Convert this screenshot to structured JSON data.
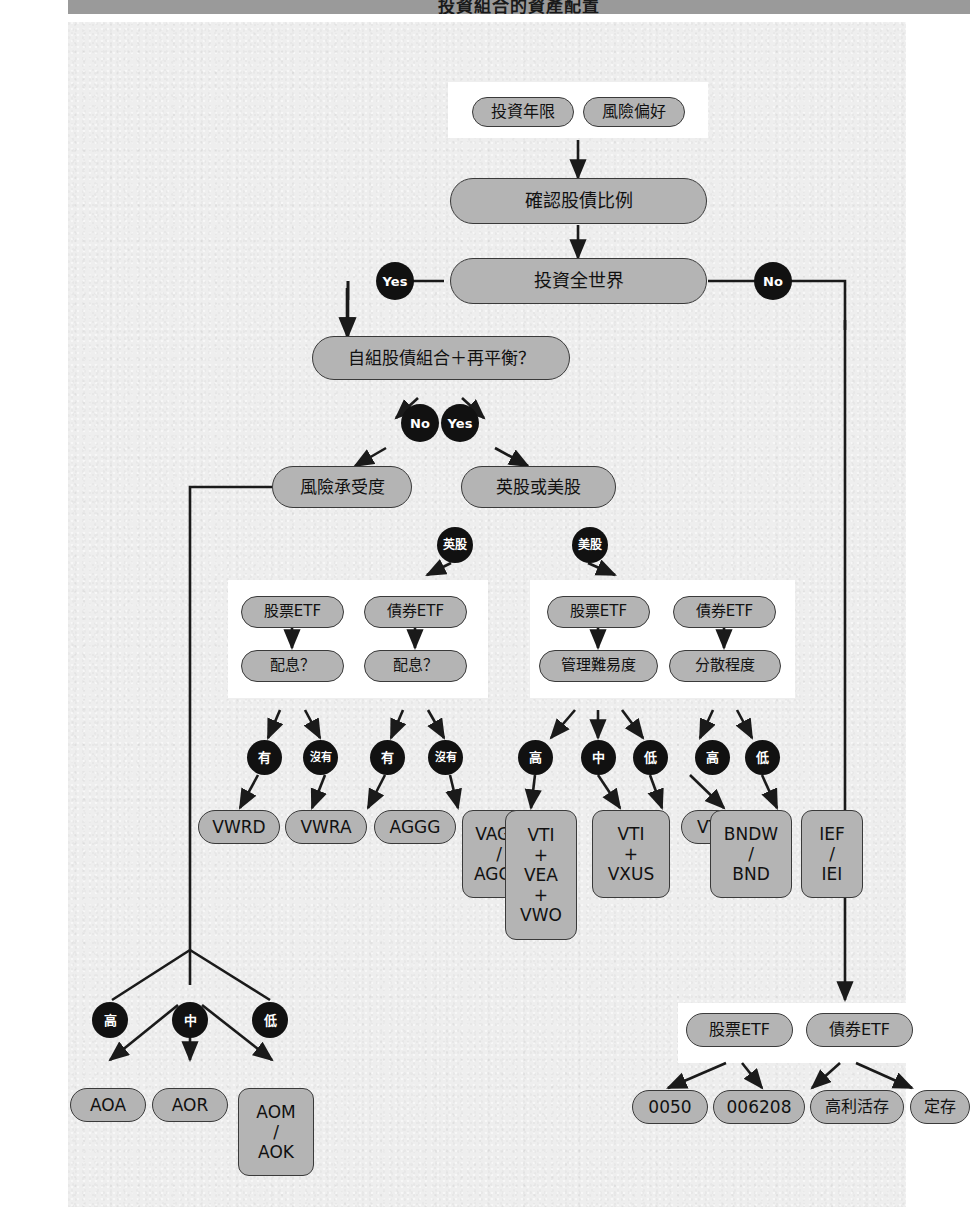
{
  "title": "投資組合的資產配置",
  "colors": {
    "node_fill": "#b4b4b4",
    "node_stroke": "#3a3a3a",
    "dot_fill": "#111111",
    "panel_fill": "#ffffff",
    "paper": "#eeeeee",
    "title_band": "#9a9a9a"
  },
  "nodes": {
    "invest_years": "投資年限",
    "risk_preference": "風險偏好",
    "confirm_ratio": "確認股債比例",
    "invest_world": "投資全世界",
    "self_build": "自組股債組合＋再平衡？",
    "risk_tolerance": "風險承受度",
    "uk_or_us": "英股或美股",
    "uk_stock_etf": "股票ETF",
    "uk_bond_etf": "債券ETF",
    "uk_dividend_stock": "配息？",
    "uk_dividend_bond": "配息？",
    "us_stock_etf": "股票ETF",
    "us_bond_etf": "債券ETF",
    "manage_difficulty": "管理難易度",
    "diversification": "分散程度",
    "tw_stock_etf": "股票ETF",
    "tw_bond_etf": "債券ETF",
    "vwrd": "VWRD",
    "vwra": "VWRA",
    "aggg": "AGGG",
    "vagu_aggu": "VAGU\n/\nAGGU",
    "vti_vea_vwo": "VTI\n+\nVEA\n+\nVWO",
    "vti_vxus": "VTI\n+\nVXUS",
    "vt": "VT",
    "bndw_bnd": "BNDW\n/\nBND",
    "ief_iei": "IEF\n/\nIEI",
    "aoa": "AOA",
    "aor": "AOR",
    "aom_aok": "AOM\n/\nAOK",
    "t0050": "0050",
    "t006208": "006208",
    "high_savings": "高利活存",
    "fixed_deposit": "定存"
  },
  "labels": {
    "yes": "Yes",
    "no": "No",
    "no2": "No",
    "yes2": "Yes",
    "uk": "英股",
    "us": "美股",
    "has1": "有",
    "none1": "沒有",
    "has2": "有",
    "none2": "沒有",
    "high_m": "高",
    "mid_m": "中",
    "low_m": "低",
    "high_d": "高",
    "low_d": "低",
    "high_r": "高",
    "mid_r": "中",
    "low_r": "低"
  }
}
